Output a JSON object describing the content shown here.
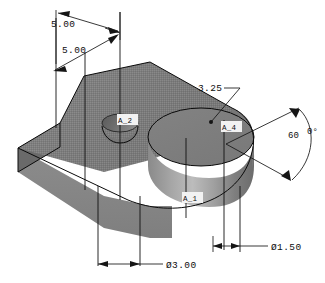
{
  "drawing": {
    "title": "Isometric solid model with dimensions",
    "background_color": "#ffffff",
    "line_color": "#151515"
  },
  "colors": {
    "top_face": "#7e7e7e",
    "bevel_face": "#6f6f6f",
    "front_face": "#8f8f8f",
    "cylinder_light": "#b4b4b4",
    "cylinder_dark": "#6a6a6a",
    "hole_inner": "#5e5e5e",
    "edge": "#0a0a0a"
  },
  "dimensions": [
    {
      "id": "dim-top-left",
      "label": "5.00",
      "kind": "linear"
    },
    {
      "id": "dim-top-inner",
      "label": "5.00",
      "kind": "linear"
    },
    {
      "id": "dim-offset",
      "label": "3.25",
      "kind": "leader"
    },
    {
      "id": "dim-angle",
      "label_left": "60",
      "label_right": "0°",
      "kind": "angular"
    },
    {
      "id": "dim-bolt-circle",
      "label": "Ø3.00",
      "kind": "diameter"
    },
    {
      "id": "dim-hole",
      "label": "Ø1.50",
      "kind": "diameter"
    }
  ],
  "axis_labels": [
    {
      "id": "axis-a2",
      "label": "A_2"
    },
    {
      "id": "axis-a4",
      "label": "A_4"
    },
    {
      "id": "axis-a1",
      "label": "A_1"
    }
  ]
}
